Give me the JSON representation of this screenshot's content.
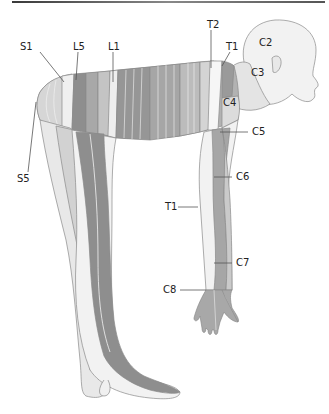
{
  "figure": {
    "labels": [
      {
        "id": "S1",
        "text": "S1",
        "x": 20,
        "y": 42
      },
      {
        "id": "L5",
        "text": "L5",
        "x": 73,
        "y": 42
      },
      {
        "id": "L1",
        "text": "L1",
        "x": 108,
        "y": 42
      },
      {
        "id": "T2",
        "text": "T2",
        "x": 207,
        "y": 20
      },
      {
        "id": "T1-top",
        "text": "T1",
        "x": 226,
        "y": 42
      },
      {
        "id": "C2",
        "text": "C2",
        "x": 259,
        "y": 38
      },
      {
        "id": "C3",
        "text": "C3",
        "x": 251,
        "y": 68
      },
      {
        "id": "C4",
        "text": "C4",
        "x": 223,
        "y": 98
      },
      {
        "id": "C5",
        "text": "C5",
        "x": 252,
        "y": 128
      },
      {
        "id": "S5",
        "text": "S5",
        "x": 17,
        "y": 174
      },
      {
        "id": "C6",
        "text": "C6",
        "x": 236,
        "y": 173
      },
      {
        "id": "T1-arm",
        "text": "T1",
        "x": 165,
        "y": 203
      },
      {
        "id": "C7",
        "text": "C7",
        "x": 236,
        "y": 258
      },
      {
        "id": "C8",
        "text": "C8",
        "x": 163,
        "y": 285
      }
    ],
    "colors": {
      "skin": "#f4f4f4",
      "light": "#e2e2e2",
      "mid": "#c4c4c4",
      "midDark": "#a8a8a8",
      "dark": "#8e8e8e",
      "outline": "#888888",
      "leader": "#555555"
    }
  }
}
